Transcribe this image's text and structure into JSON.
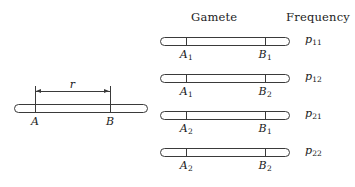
{
  "figure": {
    "headers": {
      "gamete": "Gamete",
      "frequency": "Frequency"
    },
    "parent": {
      "locus_a_label": "A",
      "locus_b_label": "B",
      "distance_label": "r",
      "chrom": {
        "x": 14,
        "y": 104,
        "width": 134
      },
      "tick_a_x": 35,
      "tick_b_x": 110,
      "dim_y": 91
    },
    "gametes": [
      {
        "a_label": "A",
        "a_sub": "1",
        "b_label": "B",
        "b_sub": "1",
        "freq_label": "p",
        "freq_sub": "11",
        "chrom": {
          "x": 160,
          "y": 37,
          "width": 130
        },
        "tick_a_x": 186,
        "tick_b_x": 265,
        "allele_y": 48,
        "freq_x": 305,
        "freq_y": 37
      },
      {
        "a_label": "A",
        "a_sub": "1",
        "b_label": "B",
        "b_sub": "2",
        "freq_label": "p",
        "freq_sub": "12",
        "chrom": {
          "x": 160,
          "y": 74,
          "width": 130
        },
        "tick_a_x": 186,
        "tick_b_x": 265,
        "allele_y": 85,
        "freq_x": 305,
        "freq_y": 74
      },
      {
        "a_label": "A",
        "a_sub": "2",
        "b_label": "B",
        "b_sub": "1",
        "freq_label": "p",
        "freq_sub": "21",
        "chrom": {
          "x": 160,
          "y": 111,
          "width": 130
        },
        "tick_a_x": 186,
        "tick_b_x": 265,
        "allele_y": 122,
        "freq_x": 305,
        "freq_y": 111
      },
      {
        "a_label": "A",
        "a_sub": "2",
        "b_label": "B",
        "b_sub": "2",
        "freq_label": "p",
        "freq_sub": "22",
        "chrom": {
          "x": 160,
          "y": 148,
          "width": 130
        },
        "tick_a_x": 186,
        "tick_b_x": 265,
        "allele_y": 159,
        "freq_x": 305,
        "freq_y": 148
      }
    ],
    "colors": {
      "stroke": "#3a3a3a",
      "text": "#1a1a1a",
      "background": "#ffffff"
    }
  }
}
